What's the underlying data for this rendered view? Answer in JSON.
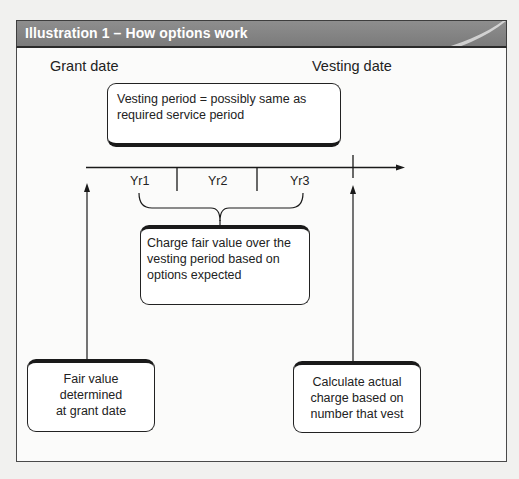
{
  "header": {
    "title": "Illustration 1 – How options work",
    "background_color": "#808080",
    "title_color": "#ffffff"
  },
  "labels": {
    "grant_date": "Grant date",
    "vesting_date": "Vesting date"
  },
  "timeline": {
    "years": [
      "Yr1",
      "Yr2",
      "Yr3"
    ]
  },
  "boxes": {
    "vesting_period": "Vesting period = possibly same as\nrequired service period",
    "charge_fair_value": "Charge fair value over the\nvesting period based on\noptions expected",
    "fair_value_grant": "Fair value\ndetermined\nat grant date",
    "calculate_actual": "Calculate actual\ncharge based on\nnumber that vest"
  }
}
